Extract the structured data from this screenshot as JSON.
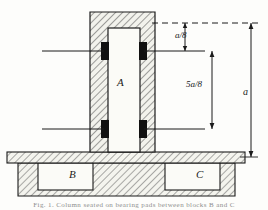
{
  "figure": {
    "kind": "engineering-cross-section",
    "background_color": "#fdfdfb",
    "line_color": "#1b1b1b",
    "hatch_color": "#4a4a4a",
    "pad_color": "#111111",
    "fill_color": "#f2f2ec"
  },
  "parts": [
    {
      "id": "A",
      "label": "A",
      "name": "column-A",
      "x": 117,
      "y": 82
    },
    {
      "id": "B",
      "label": "B",
      "name": "block-B",
      "x": 69,
      "y": 174
    },
    {
      "id": "C",
      "label": "C",
      "name": "block-C",
      "x": 196,
      "y": 174
    }
  ],
  "dimensions": [
    {
      "id": "top-gap",
      "label": "a/8",
      "name": "dimension-a-over-8",
      "x": 182,
      "y": 37
    },
    {
      "id": "span",
      "label": "5a/8",
      "name": "dimension-5a-over-8",
      "x": 192,
      "y": 85
    },
    {
      "id": "overall",
      "label": "a",
      "name": "dimension-a-overall",
      "x": 248,
      "y": 93
    }
  ],
  "caption": {
    "text": "Fig. 1.  Column seated on bearing pads between blocks B and C"
  }
}
